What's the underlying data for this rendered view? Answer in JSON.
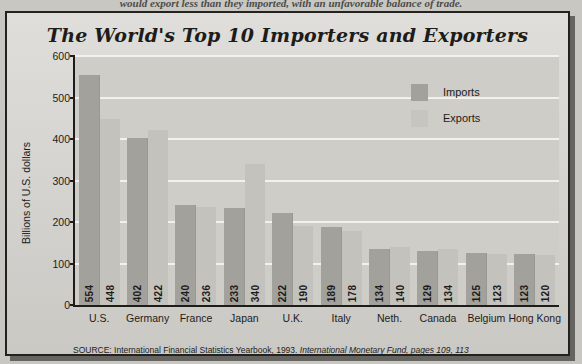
{
  "page": {
    "caption_fragment": "would export less than they imported, with an unfavorable balance of trade."
  },
  "chart": {
    "title": "The World's Top 10 Importers and Exporters",
    "y_axis_title": "Billions of U.S. dollars",
    "source_prefix": "SOURCE: International Financial Statistics Yearbook, 1993.",
    "source_italic": "International Monetary Fund, pages 109, 113",
    "legend": [
      {
        "key": "imports",
        "label": "Imports",
        "color": "#a3a19c"
      },
      {
        "key": "exports",
        "label": "Exports",
        "color": "#c7c5c0"
      }
    ]
  },
  "chart_data": {
    "type": "bar",
    "title": "The World's Top 10 Importers and Exporters",
    "xlabel": "",
    "ylabel": "Billions of U.S. dollars",
    "ylim": [
      0,
      600
    ],
    "yticks": [
      0,
      100,
      200,
      300,
      400,
      500,
      600
    ],
    "grid": true,
    "legend_position": "upper-right-inside",
    "categories": [
      "U.S.",
      "Germany",
      "France",
      "Japan",
      "U.K.",
      "Italy",
      "Neth.",
      "Canada",
      "Belgium",
      "Hong Kong"
    ],
    "series": [
      {
        "name": "Imports",
        "color": "#a3a19c",
        "values": [
          554,
          402,
          240,
          233,
          222,
          189,
          134,
          129,
          125,
          123
        ]
      },
      {
        "name": "Exports",
        "color": "#c4c2bd",
        "values": [
          448,
          422,
          236,
          340,
          190,
          178,
          140,
          134,
          123,
          120
        ]
      }
    ]
  }
}
